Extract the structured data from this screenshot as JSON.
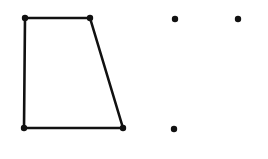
{
  "figure": {
    "width": 268,
    "height": 159,
    "background": "#ffffff",
    "stroke_color": "#111111",
    "stroke_width": 2.6,
    "dot_radius": 3.2,
    "shapes": [
      {
        "type": "quadrilateral",
        "name": "trapezoid",
        "vertices": [
          {
            "x": 25,
            "y": 18
          },
          {
            "x": 90,
            "y": 18
          },
          {
            "x": 123,
            "y": 128
          },
          {
            "x": 24,
            "y": 128
          }
        ]
      }
    ],
    "loose_points": [
      {
        "x": 175,
        "y": 19
      },
      {
        "x": 238,
        "y": 19
      },
      {
        "x": 174,
        "y": 129
      }
    ]
  }
}
